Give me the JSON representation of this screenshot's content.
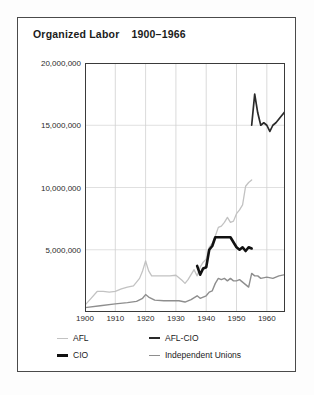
{
  "title": {
    "main": "Organized Labor",
    "range": "1900–1966"
  },
  "legend": {
    "items": [
      {
        "key": "afl",
        "label": "AFL",
        "color": "#c2c2c2"
      },
      {
        "key": "afl_cio",
        "label": "AFL-CIO",
        "color": "#2a2a2a"
      },
      {
        "key": "cio",
        "label": "CIO",
        "color": "#111111"
      },
      {
        "key": "independent",
        "label": "Independent Unions",
        "color": "#8e8e8e"
      }
    ]
  },
  "axes": {
    "y_ticks": [
      "20,000,000",
      "15,000,000",
      "10,000,000",
      "5,000,000"
    ],
    "x_ticks": [
      "1900",
      "1910",
      "1920",
      "1930",
      "1940",
      "1950",
      "1960"
    ]
  },
  "chart_data": {
    "type": "line",
    "xlabel": "",
    "ylabel": "",
    "xlim": [
      1900,
      1966
    ],
    "ylim": [
      0,
      20000000
    ],
    "grid": true,
    "legend_position": "bottom",
    "y_tick_values": [
      5000000,
      10000000,
      15000000,
      20000000
    ],
    "x_tick_values": [
      1900,
      1910,
      1920,
      1930,
      1940,
      1950,
      1960
    ],
    "series": [
      {
        "name": "AFL",
        "color": "#c2c2c2",
        "points": [
          [
            1900,
            550000
          ],
          [
            1902,
            1100000
          ],
          [
            1904,
            1650000
          ],
          [
            1906,
            1650000
          ],
          [
            1908,
            1600000
          ],
          [
            1910,
            1650000
          ],
          [
            1912,
            1850000
          ],
          [
            1914,
            2000000
          ],
          [
            1916,
            2100000
          ],
          [
            1917,
            2400000
          ],
          [
            1918,
            2700000
          ],
          [
            1919,
            3300000
          ],
          [
            1920,
            4100000
          ],
          [
            1921,
            3300000
          ],
          [
            1922,
            2900000
          ],
          [
            1924,
            2900000
          ],
          [
            1926,
            2900000
          ],
          [
            1928,
            2900000
          ],
          [
            1930,
            2950000
          ],
          [
            1932,
            2550000
          ],
          [
            1933,
            2300000
          ],
          [
            1934,
            2600000
          ],
          [
            1935,
            3000000
          ],
          [
            1936,
            3400000
          ],
          [
            1937,
            2900000
          ],
          [
            1938,
            3600000
          ],
          [
            1939,
            4000000
          ],
          [
            1940,
            4250000
          ],
          [
            1941,
            5200000
          ],
          [
            1942,
            5500000
          ],
          [
            1943,
            6100000
          ],
          [
            1944,
            6800000
          ],
          [
            1945,
            6900000
          ],
          [
            1946,
            7200000
          ],
          [
            1947,
            7600000
          ],
          [
            1948,
            7200000
          ],
          [
            1949,
            7300000
          ],
          [
            1950,
            7900000
          ],
          [
            1951,
            8200000
          ],
          [
            1952,
            8600000
          ],
          [
            1953,
            10100000
          ],
          [
            1954,
            10400000
          ],
          [
            1955,
            10600000
          ]
        ]
      },
      {
        "name": "CIO",
        "color": "#111111",
        "points": [
          [
            1937,
            3700000
          ],
          [
            1938,
            3000000
          ],
          [
            1939,
            3500000
          ],
          [
            1940,
            3600000
          ],
          [
            1941,
            5000000
          ],
          [
            1942,
            5300000
          ],
          [
            1943,
            6000000
          ],
          [
            1944,
            6000000
          ],
          [
            1945,
            6000000
          ],
          [
            1946,
            6000000
          ],
          [
            1947,
            6000000
          ],
          [
            1948,
            6000000
          ],
          [
            1949,
            5600000
          ],
          [
            1950,
            5200000
          ],
          [
            1951,
            5000000
          ],
          [
            1952,
            5200000
          ],
          [
            1953,
            4900000
          ],
          [
            1954,
            5200000
          ],
          [
            1955,
            5100000
          ]
        ]
      },
      {
        "name": "AFL-CIO",
        "color": "#2a2a2a",
        "points": [
          [
            1955,
            15000000
          ],
          [
            1956,
            17500000
          ],
          [
            1957,
            16000000
          ],
          [
            1958,
            15000000
          ],
          [
            1959,
            15200000
          ],
          [
            1960,
            15000000
          ],
          [
            1961,
            14500000
          ],
          [
            1962,
            15000000
          ],
          [
            1963,
            15200000
          ],
          [
            1964,
            15500000
          ],
          [
            1965,
            15800000
          ],
          [
            1966,
            16100000
          ]
        ]
      },
      {
        "name": "Independent Unions",
        "color": "#8e8e8e",
        "points": [
          [
            1900,
            350000
          ],
          [
            1905,
            500000
          ],
          [
            1910,
            650000
          ],
          [
            1914,
            750000
          ],
          [
            1917,
            850000
          ],
          [
            1919,
            1100000
          ],
          [
            1920,
            1400000
          ],
          [
            1921,
            1200000
          ],
          [
            1923,
            950000
          ],
          [
            1926,
            900000
          ],
          [
            1929,
            900000
          ],
          [
            1931,
            900000
          ],
          [
            1933,
            800000
          ],
          [
            1935,
            1000000
          ],
          [
            1937,
            1300000
          ],
          [
            1938,
            1100000
          ],
          [
            1939,
            1200000
          ],
          [
            1940,
            1300000
          ],
          [
            1941,
            1600000
          ],
          [
            1942,
            1700000
          ],
          [
            1943,
            2300000
          ],
          [
            1944,
            2700000
          ],
          [
            1945,
            2600000
          ],
          [
            1946,
            2700000
          ],
          [
            1947,
            2500000
          ],
          [
            1948,
            2700000
          ],
          [
            1949,
            2500000
          ],
          [
            1950,
            2500000
          ],
          [
            1951,
            2600000
          ],
          [
            1952,
            2400000
          ],
          [
            1953,
            2200000
          ],
          [
            1954,
            2000000
          ],
          [
            1955,
            3100000
          ],
          [
            1956,
            2900000
          ],
          [
            1957,
            2900000
          ],
          [
            1958,
            2700000
          ],
          [
            1960,
            2800000
          ],
          [
            1962,
            2700000
          ],
          [
            1964,
            2900000
          ],
          [
            1966,
            3000000
          ]
        ]
      }
    ]
  }
}
